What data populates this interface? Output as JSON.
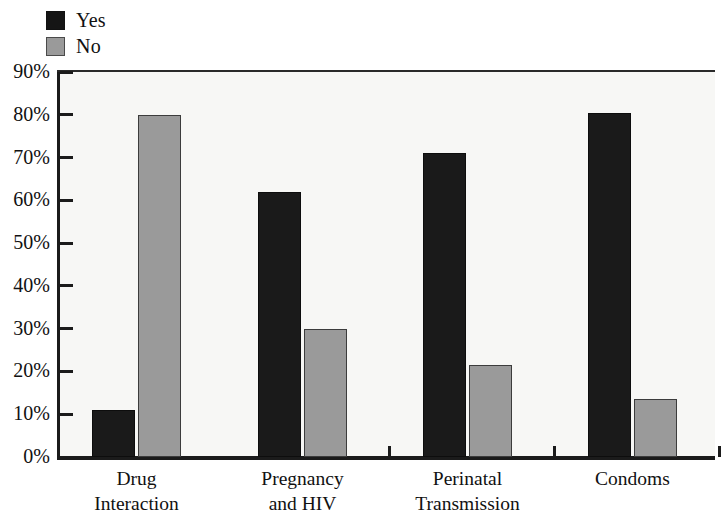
{
  "chart_data": {
    "type": "bar",
    "title": "",
    "subtitle": "",
    "xlabel": "",
    "ylabel": "",
    "ylim": [
      0,
      90
    ],
    "ytick_labels": [
      "90%",
      "80%",
      "70%",
      "60%",
      "50%",
      "40%",
      "30%",
      "20%",
      "10%",
      "0%"
    ],
    "ytick_values": [
      90,
      80,
      70,
      60,
      50,
      40,
      30,
      20,
      10,
      0
    ],
    "grid": false,
    "legend_position": "top-left",
    "value_unit": "%",
    "categories": [
      "Drug Interaction",
      "Pregnancy and HIV",
      "Perinatal Transmission",
      "Condoms"
    ],
    "category_lines": [
      [
        "Drug",
        "Interaction"
      ],
      [
        "Pregnancy",
        "and HIV"
      ],
      [
        "Perinatal",
        "Transmission"
      ],
      [
        "Condoms"
      ]
    ],
    "series": [
      {
        "name": "Yes",
        "color": "#1a1a1a",
        "values": [
          11,
          62,
          71,
          80.5
        ]
      },
      {
        "name": "No",
        "color": "#9a9a9a",
        "values": [
          80,
          30,
          21.5,
          13.5
        ]
      }
    ]
  },
  "legend": {
    "items": [
      {
        "label": "Yes",
        "swatch": "yes"
      },
      {
        "label": "No",
        "swatch": "no"
      }
    ]
  },
  "colors": {
    "yes_fill": "#1a1a1a",
    "no_fill": "#9a9a9a",
    "no_border": "#3c3c3c",
    "axis": "#1b1b1b",
    "plot_background": "#f7f7f5",
    "page_background": "#ffffff"
  }
}
